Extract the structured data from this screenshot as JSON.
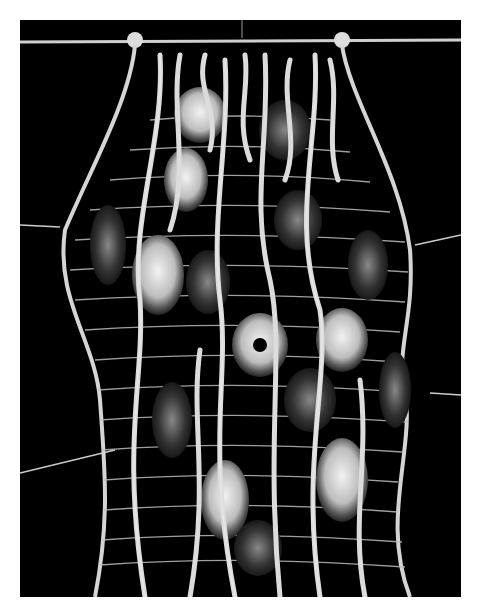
{
  "image": {
    "subject": "woven fiber wall hanging with agate slices",
    "background_color": "#000000",
    "border_color": "#ffffff",
    "fiber_color": "#d8d8d8",
    "agate_count": 16
  }
}
